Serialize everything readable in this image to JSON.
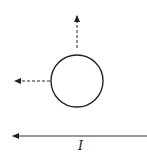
{
  "diagram": {
    "circle": {
      "cx": 77,
      "cy": 81,
      "r": 26,
      "stroke": "#222222"
    },
    "arrows": {
      "up": {
        "x1": 77,
        "y1": 47,
        "x2": 77,
        "y2": 15,
        "style": "dashed"
      },
      "left": {
        "x1": 51,
        "y1": 81,
        "x2": 14,
        "y2": 81,
        "style": "dashed"
      }
    },
    "wire": {
      "x1": 147,
      "y1": 136,
      "x2": 12,
      "y2": 136,
      "style": "solid",
      "direction": "left"
    },
    "current_label": "I",
    "colors": {
      "ink": "#222222",
      "background": "#ffffff"
    }
  }
}
